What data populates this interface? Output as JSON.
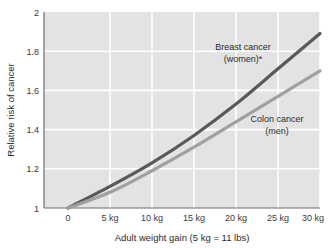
{
  "chart_data": {
    "type": "line",
    "title": "",
    "xlabel": "Adult weight gain (5 kg = 11 lbs)",
    "ylabel": "Relative risk of cancer",
    "xtick_labels": [
      "0",
      "5 kg",
      "10 kg",
      "15 kg",
      "20 kg",
      "25 kg",
      "30 kg"
    ],
    "ytick_labels": [
      "1",
      "1.2",
      "1.4",
      "1.6",
      "1.8",
      "2"
    ],
    "x": [
      0,
      5,
      10,
      15,
      20,
      25,
      30
    ],
    "xlim": [
      0,
      30
    ],
    "ylim": [
      1,
      2
    ],
    "grid": true,
    "legend_position": "inline-annotations",
    "plot_background": "#e3e3e3",
    "gridline_color": "#ffffff",
    "series": [
      {
        "name": "Breast cancer (women)*",
        "color": "#59595b",
        "values": [
          1.0,
          1.11,
          1.23,
          1.37,
          1.53,
          1.71,
          1.89
        ]
      },
      {
        "name": "Colon cancer (men)",
        "color": "#a0a0a2",
        "values": [
          1.0,
          1.08,
          1.19,
          1.31,
          1.44,
          1.57,
          1.7
        ]
      }
    ],
    "annotations": [
      {
        "text_line1": "Breast cancer",
        "text_line2": "(women)*"
      },
      {
        "text_line1": "Colon cancer",
        "text_line2": "(men)"
      }
    ]
  }
}
